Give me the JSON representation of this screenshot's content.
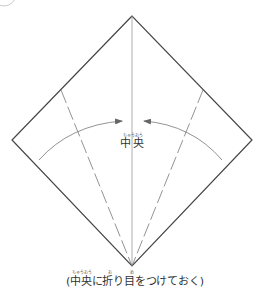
{
  "diagram": {
    "type": "origami-fold-instruction",
    "shape": "square-rotated-45 (diamond)",
    "vertices": {
      "top": [
        132,
        16
      ],
      "left": [
        12,
        140
      ],
      "right": [
        252,
        140
      ],
      "bottom": [
        132,
        266
      ]
    },
    "colors": {
      "outline": "#444444",
      "crease": "#888888",
      "arrow": "#777777",
      "text": "#333333"
    },
    "lines": [
      {
        "name": "center-crease",
        "style": "solid-thin",
        "from": [
          132,
          16
        ],
        "to": [
          132,
          266
        ]
      },
      {
        "name": "left-valley-fold",
        "style": "dashed",
        "from": [
          61,
          90
        ],
        "to": [
          132,
          266
        ]
      },
      {
        "name": "right-valley-fold",
        "style": "dashed",
        "from": [
          203,
          90
        ],
        "to": [
          132,
          266
        ]
      }
    ],
    "arrows": [
      {
        "name": "left-fold-arrow",
        "from": [
          39,
          160
        ],
        "to": [
          122,
          121
        ],
        "direction": "toward-center"
      },
      {
        "name": "right-fold-arrow",
        "from": [
          222,
          160
        ],
        "to": [
          144,
          121
        ],
        "direction": "toward-center"
      }
    ]
  },
  "labels": {
    "center": {
      "ruby": "ちゅうおう",
      "text": "中央"
    },
    "caption": {
      "text": "(中央に折り目をつけておく)",
      "ruby": [
        {
          "over": "中央",
          "reading": "ちゅうおう"
        },
        {
          "over": "折",
          "reading": "お"
        },
        {
          "over": "目",
          "reading": "め"
        }
      ]
    }
  }
}
